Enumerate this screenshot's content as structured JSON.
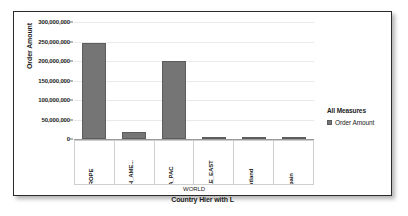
{
  "chart_data": {
    "type": "bar",
    "title": "",
    "categories": [
      "EUROPE",
      "NORTH_AME...",
      "ASIA_PAC",
      "MIDDLE_EAST",
      "Scotland",
      "Spain"
    ],
    "values": [
      245000000,
      18000000,
      200000000,
      6000000,
      1000000,
      4000000
    ],
    "series": [
      {
        "name": "Order Amount",
        "values": [
          245000000,
          18000000,
          200000000,
          6000000,
          1000000,
          4000000
        ]
      }
    ],
    "xlabel": "Country Hier with L",
    "ylabel": "Order Amount",
    "group_label": "WORLD",
    "ylim": [
      0,
      300000000
    ],
    "ytick_values": [
      300000000,
      250000000,
      200000000,
      150000000,
      100000000,
      50000000,
      0
    ],
    "ytick_labels": [
      "300,000,000",
      "250,000,000",
      "200,000,000",
      "150,000,000",
      "100,000,000",
      "50,000,000",
      "0"
    ],
    "grid": true,
    "legend_position": "right",
    "bar_color": "#757575",
    "bar_border_color": "#5d5d5d",
    "grid_color": "#e9e9e9",
    "text_color": "#1b1b1b"
  },
  "legend": {
    "title": "All Measures",
    "entries": [
      {
        "label": "Order Amount",
        "color": "#757575"
      }
    ]
  }
}
